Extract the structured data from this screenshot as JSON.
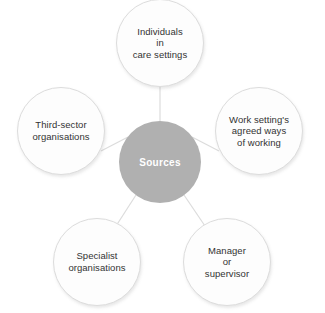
{
  "diagram": {
    "type": "radial-hub-and-spoke",
    "hub": {
      "label": "Sources",
      "fill_color": "#b0b0b0",
      "text_color": "#ffffff",
      "center_x": 160,
      "center_y": 162,
      "radius": 41
    },
    "connector_color": "#dcdcdc",
    "satellite_style": {
      "fill_color": "#fdfdfd",
      "outline_color": "#dcdcdc",
      "text_color": "#333333",
      "radius": 44
    },
    "nodes": [
      {
        "id": "individuals-in-care-settings",
        "lines": [
          "Individuals",
          "in",
          "care settings"
        ],
        "text": "Individuals in care settings",
        "center_x": 160,
        "center_y": 43,
        "position": "top"
      },
      {
        "id": "work-settings-agreed-ways-of-working",
        "lines": [
          "Work setting's",
          "agreed ways",
          "of working"
        ],
        "text": "Work setting's agreed ways of working",
        "center_x": 259,
        "center_y": 131,
        "position": "right"
      },
      {
        "id": "manager-or-supervisor",
        "lines": [
          "Manager",
          "or",
          "supervisor"
        ],
        "text": "Manager or supervisor",
        "center_x": 227,
        "center_y": 262,
        "position": "bottom-right"
      },
      {
        "id": "specialist-organisations",
        "lines": [
          "Specialist",
          "organisations"
        ],
        "text": "Specialist organisations",
        "center_x": 97,
        "center_y": 262,
        "position": "bottom-left"
      },
      {
        "id": "third-sector-organisations",
        "lines": [
          "Third-sector",
          "organisations"
        ],
        "text": "Third-sector organisations",
        "center_x": 61,
        "center_y": 131,
        "position": "left"
      }
    ]
  }
}
